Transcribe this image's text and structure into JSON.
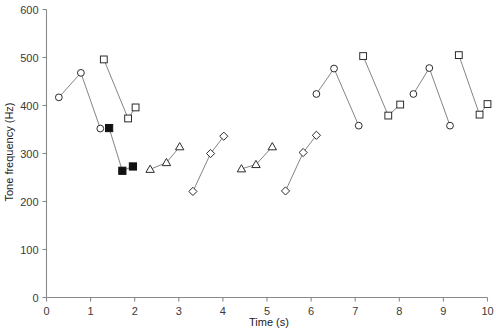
{
  "chart_data": {
    "type": "scatter",
    "title": "",
    "subtitle": "",
    "xlabel": "Time (s)",
    "ylabel": "Tone frequency (Hz)",
    "xlim": [
      0,
      10
    ],
    "ylim": [
      0,
      600
    ],
    "xticks": [
      0,
      1,
      2,
      3,
      4,
      5,
      6,
      7,
      8,
      9,
      10
    ],
    "xtick_labels": [
      "0",
      "1",
      "2",
      "3",
      "4",
      "5",
      "6",
      "7",
      "8",
      "9",
      "10"
    ],
    "yticks": [
      0,
      100,
      200,
      300,
      400,
      500,
      600
    ],
    "ytick_labels": [
      "0",
      "100",
      "200",
      "300",
      "400",
      "500",
      "600"
    ],
    "grid": false,
    "legend_position": "none",
    "series": [
      {
        "name": "circle-group-1",
        "marker": "open-circle",
        "connected": true,
        "points": [
          {
            "x": 0.28,
            "y": 417
          },
          {
            "x": 0.78,
            "y": 468
          },
          {
            "x": 1.22,
            "y": 352
          }
        ]
      },
      {
        "name": "square-group-1",
        "marker": "open-square",
        "connected": true,
        "points": [
          {
            "x": 1.3,
            "y": 496
          },
          {
            "x": 1.85,
            "y": 373
          },
          {
            "x": 2.02,
            "y": 396
          }
        ]
      },
      {
        "name": "filled-square-group-1",
        "marker": "filled-square",
        "connected": true,
        "points": [
          {
            "x": 1.42,
            "y": 353
          },
          {
            "x": 1.72,
            "y": 264
          },
          {
            "x": 1.96,
            "y": 273
          }
        ]
      },
      {
        "name": "triangle-group-1",
        "marker": "open-triangle",
        "connected": true,
        "points": [
          {
            "x": 2.35,
            "y": 267
          },
          {
            "x": 2.72,
            "y": 281
          },
          {
            "x": 3.02,
            "y": 314
          }
        ]
      },
      {
        "name": "diamond-group-1",
        "marker": "open-diamond",
        "connected": true,
        "points": [
          {
            "x": 3.32,
            "y": 221
          },
          {
            "x": 3.72,
            "y": 300
          },
          {
            "x": 4.02,
            "y": 336
          }
        ]
      },
      {
        "name": "triangle-group-2",
        "marker": "open-triangle",
        "connected": true,
        "points": [
          {
            "x": 4.42,
            "y": 268
          },
          {
            "x": 4.75,
            "y": 277
          },
          {
            "x": 5.12,
            "y": 314
          }
        ]
      },
      {
        "name": "diamond-group-2",
        "marker": "open-diamond",
        "connected": true,
        "points": [
          {
            "x": 5.42,
            "y": 222
          },
          {
            "x": 5.82,
            "y": 302
          },
          {
            "x": 6.12,
            "y": 338
          }
        ]
      },
      {
        "name": "circle-group-2",
        "marker": "open-circle",
        "connected": true,
        "points": [
          {
            "x": 6.12,
            "y": 424
          },
          {
            "x": 6.52,
            "y": 477
          },
          {
            "x": 7.08,
            "y": 358
          }
        ]
      },
      {
        "name": "square-group-2",
        "marker": "open-square",
        "connected": true,
        "points": [
          {
            "x": 7.18,
            "y": 503
          },
          {
            "x": 7.75,
            "y": 379
          },
          {
            "x": 8.02,
            "y": 402
          }
        ]
      },
      {
        "name": "circle-group-3",
        "marker": "open-circle",
        "connected": true,
        "points": [
          {
            "x": 8.32,
            "y": 424
          },
          {
            "x": 8.68,
            "y": 478
          },
          {
            "x": 9.15,
            "y": 358
          }
        ]
      },
      {
        "name": "square-group-3",
        "marker": "open-square",
        "connected": true,
        "points": [
          {
            "x": 9.35,
            "y": 505
          },
          {
            "x": 9.82,
            "y": 381
          },
          {
            "x": 10.0,
            "y": 403
          }
        ]
      }
    ]
  },
  "colors": {
    "axis": "#8a8a8a",
    "line": "#6e6e6e",
    "marker_stroke": "#2b2b2b",
    "marker_fill_open": "#ffffff",
    "marker_fill_solid": "#111111",
    "text": "#1a1a1a",
    "background": "#ffffff"
  }
}
